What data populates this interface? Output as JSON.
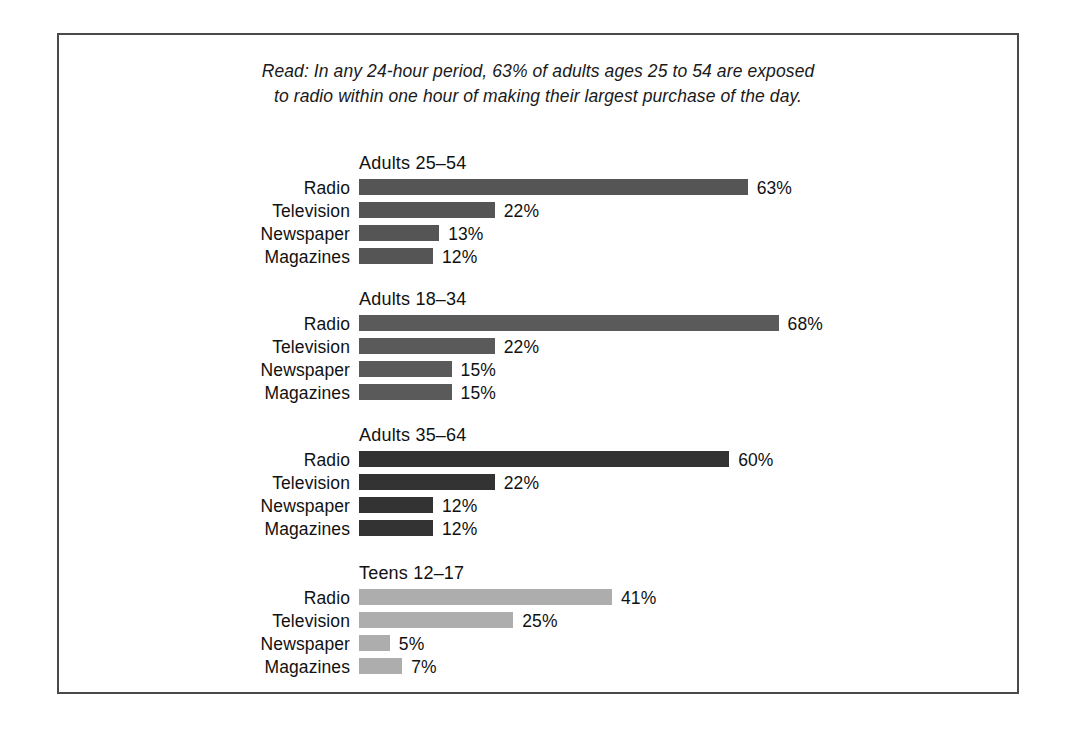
{
  "caption": {
    "line1": "Read: In any 24-hour period, 63% of adults ages 25 to 54 are exposed",
    "line2": "to radio within one hour of making their largest purchase of the day."
  },
  "chart_data": {
    "type": "bar",
    "orientation": "horizontal",
    "title": "",
    "subtitle": "Read: In any 24-hour period, 63% of adults ages 25 to 54 are exposed to radio within one hour of making their largest purchase of the day.",
    "xlabel": "",
    "ylabel": "",
    "xlim": [
      0,
      68
    ],
    "grid": false,
    "legend": "none",
    "value_suffix": "%",
    "categories": [
      "Radio",
      "Television",
      "Newspaper",
      "Magazines"
    ],
    "panels": [
      {
        "title": "Adults 25–54",
        "color": "#555555",
        "values": [
          63,
          22,
          13,
          12
        ],
        "labels": [
          "63%",
          "22%",
          "13%",
          "12%"
        ]
      },
      {
        "title": "Adults 18–34",
        "color": "#5a5a5a",
        "values": [
          68,
          22,
          15,
          15
        ],
        "labels": [
          "68%",
          "22%",
          "15%",
          "15%"
        ]
      },
      {
        "title": "Adults 35–64",
        "color": "#333333",
        "values": [
          60,
          22,
          12,
          12
        ],
        "labels": [
          "60%",
          "22%",
          "12%",
          "12%"
        ]
      },
      {
        "title": "Teens 12–17",
        "color": "#adadad",
        "values": [
          41,
          25,
          5,
          7
        ],
        "labels": [
          "41%",
          "25%",
          "5%",
          "7%"
        ]
      }
    ]
  },
  "layout": {
    "px_per_percent": 6.17,
    "panel_tops": [
      118,
      254,
      390,
      528
    ],
    "border_color": "#4a4a4a"
  }
}
